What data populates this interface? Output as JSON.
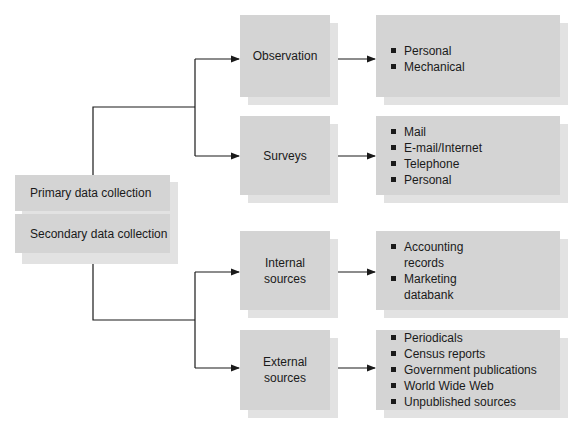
{
  "diagram": {
    "root": {
      "primary_label": "Primary data collection",
      "secondary_label": "Secondary data collection"
    },
    "branches": [
      {
        "label": "Observation",
        "items": [
          "Personal",
          "Mechanical"
        ]
      },
      {
        "label": "Surveys",
        "items": [
          "Mail",
          "E-mail/Internet",
          "Telephone",
          "Personal"
        ]
      },
      {
        "label": "Internal sources",
        "items": [
          "Accounting records",
          "Marketing databank"
        ]
      },
      {
        "label": "External sources",
        "items": [
          "Periodicals",
          "Census reports",
          "Government publications",
          "World Wide Web",
          "Unpublished sources"
        ]
      }
    ],
    "colors": {
      "box": "#d4d4d4",
      "shadow": "#e2e2e2",
      "line": "#1a1a1a"
    }
  }
}
